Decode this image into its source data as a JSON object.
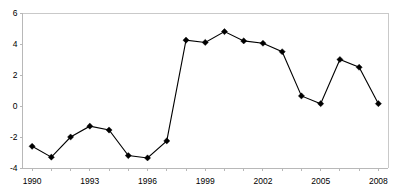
{
  "chart_data": {
    "type": "line",
    "title": "",
    "subtitle": "",
    "xlabel": "",
    "ylabel": "",
    "x": [
      1990,
      1991,
      1992,
      1993,
      1994,
      1995,
      1996,
      1997,
      1998,
      1999,
      2000,
      2001,
      2002,
      2003,
      2004,
      2005,
      2006,
      2007,
      2008
    ],
    "values": [
      -2.6,
      -3.3,
      -2.0,
      -1.3,
      -1.55,
      -3.2,
      -3.35,
      -2.25,
      4.25,
      4.1,
      4.8,
      4.2,
      4.05,
      3.5,
      0.65,
      0.15,
      3.0,
      2.5,
      0.15
    ],
    "series": [
      {
        "name": "",
        "values": [
          -2.6,
          -3.3,
          -2.0,
          -1.3,
          -1.55,
          -3.2,
          -3.35,
          -2.25,
          4.25,
          4.1,
          4.8,
          4.2,
          4.05,
          3.5,
          0.65,
          0.15,
          3.0,
          2.5,
          0.15
        ]
      }
    ],
    "xlim": [
      1989.5,
      2008.5
    ],
    "ylim": [
      -4,
      6
    ],
    "y_ticks": [
      -4,
      -2,
      0,
      2,
      4,
      6
    ],
    "y_tick_labels": [
      "-4",
      "-2",
      "0",
      "2",
      "4",
      "6"
    ],
    "x_tick_labels": [
      "1990",
      "1993",
      "1996",
      "1999",
      "2002",
      "2005",
      "2008"
    ],
    "x_tick_values": [
      1990,
      1993,
      1996,
      1999,
      2002,
      2005,
      2008
    ],
    "x_minor_ticks": [
      1990,
      1991,
      1992,
      1993,
      1994,
      1995,
      1996,
      1997,
      1998,
      1999,
      2000,
      2001,
      2002,
      2003,
      2004,
      2005,
      2006,
      2007,
      2008
    ],
    "grid": false,
    "legend": false,
    "legend_position": "none",
    "marker": "diamond",
    "line_color": "#000000",
    "marker_color": "#000000",
    "axis_color": "#b8b8b8",
    "background_color": "#ffffff"
  }
}
